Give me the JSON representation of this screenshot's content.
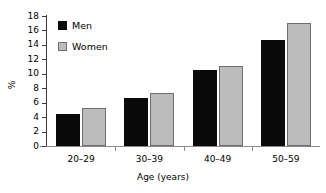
{
  "chart_data": {
    "type": "bar",
    "title": "",
    "subtitle": "",
    "xlabel": "Age (years)",
    "ylabel": "%",
    "categories": [
      "20–29",
      "30–39",
      "40–49",
      "50–59"
    ],
    "series": [
      {
        "name": "Men",
        "color": "#0a0a0a",
        "values": [
          4.4,
          6.6,
          10.5,
          14.7
        ]
      },
      {
        "name": "Women",
        "color": "#bcbcbc",
        "values": [
          5.3,
          7.4,
          11.1,
          17.0
        ]
      }
    ],
    "ylim": [
      0,
      18
    ],
    "ytick_step": 2,
    "yticks": [
      0,
      2,
      4,
      6,
      8,
      10,
      12,
      14,
      16,
      18
    ],
    "ytick_labels": [
      "0",
      "2",
      "4",
      "6",
      "8",
      "10",
      "12",
      "14",
      "16",
      "18"
    ],
    "grid": false,
    "legend_position": "upper left",
    "legend": [
      {
        "label": "Men",
        "swatch": "men"
      },
      {
        "label": "Women",
        "swatch": "women"
      }
    ]
  }
}
